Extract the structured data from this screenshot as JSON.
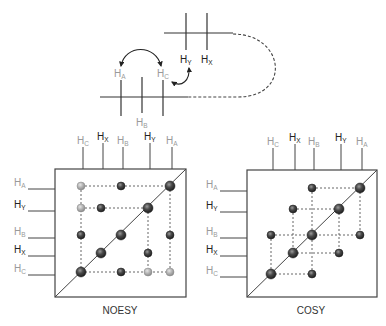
{
  "colors": {
    "dark_label": "#222222",
    "light_label": "#9a9a9a",
    "line": "#444444",
    "peak_dark": "#3a3a3a",
    "peak_light": "#a8a8a8"
  },
  "molecule": {
    "top_fragment": {
      "labels": [
        {
          "base": "H",
          "sub": "Y",
          "tone": "dark"
        },
        {
          "base": "H",
          "sub": "X",
          "tone": "dark"
        }
      ]
    },
    "bottom_fragment": {
      "labels_above": [
        {
          "base": "H",
          "sub": "A",
          "tone": "light"
        },
        {
          "base": "H",
          "sub": "C",
          "tone": "light"
        }
      ],
      "labels_below": [
        {
          "base": "H",
          "sub": "B",
          "tone": "light"
        }
      ]
    },
    "arrows": [
      {
        "from": "HA",
        "to": "HC",
        "type": "double-headed-arc"
      },
      {
        "from": "HC",
        "to": "HY",
        "type": "double-headed-arc"
      }
    ],
    "connector": "dashed-loop"
  },
  "spectra": [
    {
      "id": "noesy",
      "title": "NOESY",
      "top_axis": [
        "HC",
        "HX",
        "HB",
        "HY",
        "HA"
      ],
      "left_axis": [
        "HA",
        "HY",
        "HB",
        "HX",
        "HC"
      ],
      "peaks": [
        {
          "col": "HC",
          "row": "HA",
          "tone": "light"
        },
        {
          "col": "HB",
          "row": "HA",
          "tone": "dark"
        },
        {
          "col": "HA",
          "row": "HA",
          "tone": "dark",
          "diag": true
        },
        {
          "col": "HC",
          "row": "HY",
          "tone": "light"
        },
        {
          "col": "HX",
          "row": "HY",
          "tone": "dark"
        },
        {
          "col": "HY",
          "row": "HY",
          "tone": "dark",
          "diag": true
        },
        {
          "col": "HC",
          "row": "HB",
          "tone": "dark"
        },
        {
          "col": "HB",
          "row": "HB",
          "tone": "dark",
          "diag": true
        },
        {
          "col": "HA",
          "row": "HB",
          "tone": "dark"
        },
        {
          "col": "HX",
          "row": "HX",
          "tone": "dark",
          "diag": true
        },
        {
          "col": "HY",
          "row": "HX",
          "tone": "dark"
        },
        {
          "col": "HC",
          "row": "HC",
          "tone": "dark",
          "diag": true
        },
        {
          "col": "HB",
          "row": "HC",
          "tone": "dark"
        },
        {
          "col": "HY",
          "row": "HC",
          "tone": "light"
        },
        {
          "col": "HA",
          "row": "HC",
          "tone": "light"
        }
      ],
      "dashed_rows": [
        {
          "row": "HA",
          "from": "HC",
          "to": "HA"
        },
        {
          "row": "HY",
          "from": "HC",
          "to": "HY"
        },
        {
          "row": "HC",
          "from": "HC",
          "to": "HA"
        }
      ],
      "dashed_cols": [
        {
          "col": "HC",
          "from": "HA",
          "to": "HC"
        },
        {
          "col": "HY",
          "from": "HY",
          "to": "HC"
        },
        {
          "col": "HA",
          "from": "HA",
          "to": "HC"
        }
      ]
    },
    {
      "id": "cosy",
      "title": "COSY",
      "top_axis": [
        "HC",
        "HX",
        "HB",
        "HY",
        "HA"
      ],
      "left_axis": [
        "HA",
        "HY",
        "HB",
        "HX",
        "HC"
      ],
      "peaks": [
        {
          "col": "HB",
          "row": "HA",
          "tone": "dark"
        },
        {
          "col": "HA",
          "row": "HA",
          "tone": "dark",
          "diag": true
        },
        {
          "col": "HX",
          "row": "HY",
          "tone": "dark"
        },
        {
          "col": "HY",
          "row": "HY",
          "tone": "dark",
          "diag": true
        },
        {
          "col": "HC",
          "row": "HB",
          "tone": "dark"
        },
        {
          "col": "HB",
          "row": "HB",
          "tone": "dark",
          "diag": true
        },
        {
          "col": "HA",
          "row": "HB",
          "tone": "dark"
        },
        {
          "col": "HX",
          "row": "HX",
          "tone": "dark",
          "diag": true
        },
        {
          "col": "HY",
          "row": "HX",
          "tone": "dark"
        },
        {
          "col": "HC",
          "row": "HC",
          "tone": "dark",
          "diag": true
        },
        {
          "col": "HB",
          "row": "HC",
          "tone": "dark"
        }
      ],
      "dashed_rows": [
        {
          "row": "HA",
          "from": "HB",
          "to": "HA"
        },
        {
          "row": "HY",
          "from": "HX",
          "to": "HY"
        },
        {
          "row": "HB",
          "from": "HC",
          "to": "HA"
        },
        {
          "row": "HX",
          "from": "HX",
          "to": "HY"
        },
        {
          "row": "HC",
          "from": "HC",
          "to": "HB"
        }
      ],
      "dashed_cols": [
        {
          "col": "HC",
          "from": "HB",
          "to": "HC"
        },
        {
          "col": "HX",
          "from": "HY",
          "to": "HX"
        },
        {
          "col": "HB",
          "from": "HA",
          "to": "HC"
        },
        {
          "col": "HY",
          "from": "HY",
          "to": "HX"
        },
        {
          "col": "HA",
          "from": "HA",
          "to": "HB"
        }
      ]
    }
  ],
  "label_tones": {
    "HA": "light",
    "HB": "light",
    "HC": "light",
    "HX": "dark",
    "HY": "dark"
  }
}
